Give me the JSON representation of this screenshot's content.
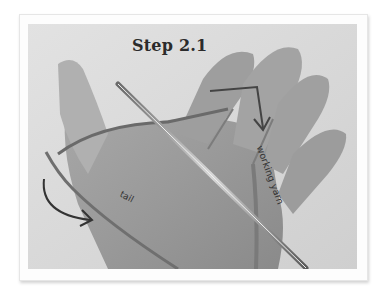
{
  "figure": {
    "title": "Step 2.1",
    "labels": {
      "tail": "tail",
      "working_yarn": "working yarn"
    },
    "arrows": [
      "curved-arrow-left",
      "bent-arrow-top-right"
    ]
  }
}
